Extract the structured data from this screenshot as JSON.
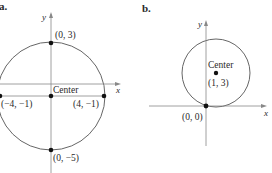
{
  "figure": {
    "panels": [
      {
        "label": "a.",
        "axes": {
          "x": "x",
          "y": "y"
        },
        "center_label": "Center",
        "points": [
          {
            "name": "top",
            "label": "(0, 3)"
          },
          {
            "name": "left",
            "label": "(−4, −1)"
          },
          {
            "name": "right",
            "label": "(4, −1)"
          },
          {
            "name": "bottom",
            "label": "(0, −5)"
          }
        ]
      },
      {
        "label": "b.",
        "axes": {
          "x": "x",
          "y": "y"
        },
        "center_label": "Center",
        "center_coords": "(1, 3)",
        "points": [
          {
            "name": "origin",
            "label": "(0, 0)"
          }
        ]
      }
    ],
    "colors": {
      "line": "#555555",
      "axis": "#777777",
      "point": "#111111",
      "text": "#2a2a2a"
    }
  }
}
